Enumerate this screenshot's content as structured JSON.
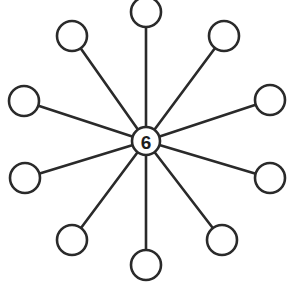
{
  "diagram": {
    "type": "star-graph",
    "center": {
      "label": "6",
      "x": 146,
      "y": 141,
      "r": 14
    },
    "leaf_radius": 15,
    "stroke_color": "#2a2a2a",
    "background": "#ffffff",
    "leaves": [
      {
        "id": "top",
        "label": "",
        "x": 146,
        "y": 12
      },
      {
        "id": "upper-right",
        "label": "",
        "x": 224,
        "y": 36
      },
      {
        "id": "right-upper",
        "label": "",
        "x": 270,
        "y": 100
      },
      {
        "id": "right-lower",
        "label": "",
        "x": 270,
        "y": 178
      },
      {
        "id": "lower-right",
        "label": "",
        "x": 222,
        "y": 240
      },
      {
        "id": "bottom",
        "label": "",
        "x": 146,
        "y": 265
      },
      {
        "id": "lower-left",
        "label": "",
        "x": 72,
        "y": 240
      },
      {
        "id": "left-lower",
        "label": "",
        "x": 25,
        "y": 178
      },
      {
        "id": "left-upper",
        "label": "",
        "x": 24,
        "y": 101
      },
      {
        "id": "upper-left",
        "label": "",
        "x": 72,
        "y": 36
      }
    ]
  }
}
